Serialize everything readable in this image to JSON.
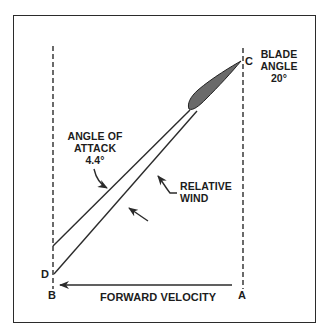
{
  "diagram": {
    "type": "propeller blade angle vector diagram",
    "labels": {
      "blade_angle_line1": "BLADE",
      "blade_angle_line2": "ANGLE",
      "blade_angle_value": "20°",
      "angle_of_attack_line1": "ANGLE OF",
      "angle_of_attack_line2": "ATTACK",
      "angle_of_attack_value": "4.4°",
      "relative_wind_line1": "RELATIVE",
      "relative_wind_line2": "WIND",
      "forward_velocity": "FORWARD VELOCITY"
    },
    "points": {
      "A": "A",
      "B": "B",
      "C": "C",
      "D": "D"
    },
    "colors": {
      "line": "#2b2b2b",
      "blade_fill": "#6a6a6a",
      "background": "#ffffff"
    }
  }
}
